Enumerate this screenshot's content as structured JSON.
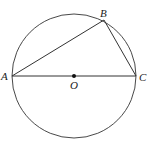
{
  "diagram": {
    "type": "geometry",
    "circle": {
      "center": "O",
      "cx": 74,
      "cy": 76,
      "r": 62
    },
    "points": {
      "A": {
        "label": "A",
        "x": 12,
        "y": 76
      },
      "B": {
        "label": "B",
        "x": 104,
        "y": 20
      },
      "C": {
        "label": "C",
        "x": 136,
        "y": 76
      },
      "O": {
        "label": "O",
        "x": 74,
        "y": 76
      }
    },
    "segments": [
      [
        "A",
        "B"
      ],
      [
        "B",
        "C"
      ],
      [
        "A",
        "C"
      ]
    ],
    "colors": {
      "stroke": "#333333",
      "background": "#ffffff"
    }
  }
}
